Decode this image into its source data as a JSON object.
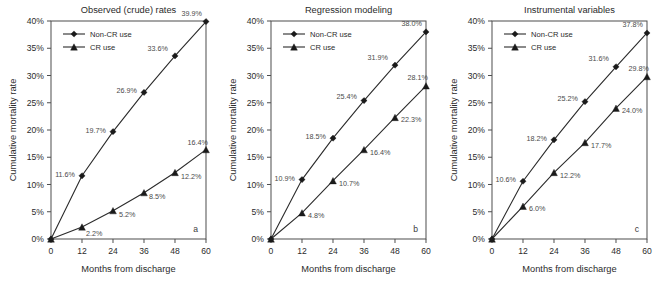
{
  "figure": {
    "panel_letters": [
      "a",
      "b",
      "c"
    ],
    "shared_xlabel": "Months from discharge",
    "shared_ylabel": "Cumulative mortality rate",
    "legend_entries": [
      {
        "label": "Non-CR use",
        "marker": "diamond-marker-icon"
      },
      {
        "label": "CR use",
        "marker": "triangle-marker-icon"
      }
    ]
  },
  "chart_data": [
    {
      "type": "line",
      "title": "Observed (crude) rates",
      "panel": "a",
      "xlabel": "Months from discharge",
      "ylabel": "Cumulative mortality rate",
      "x": [
        0,
        12,
        24,
        36,
        48,
        60
      ],
      "xlim": [
        0,
        60
      ],
      "ylim": [
        0,
        40
      ],
      "xticks": [
        "0",
        "12",
        "24",
        "36",
        "48",
        "60"
      ],
      "yticks": [
        "0%",
        "5%",
        "10%",
        "15%",
        "20%",
        "25%",
        "30%",
        "35%",
        "40%"
      ],
      "grid": false,
      "legend_position": "upper-left-inside",
      "series": [
        {
          "name": "Non-CR use",
          "marker": "diamond",
          "values": [
            0,
            11.6,
            19.7,
            26.9,
            33.6,
            39.9
          ],
          "labels": [
            "",
            "11.6%",
            "19.7%",
            "26.9%",
            "33.6%",
            "39.9%"
          ]
        },
        {
          "name": "CR use",
          "marker": "triangle",
          "values": [
            0,
            2.2,
            5.2,
            8.5,
            12.2,
            16.4
          ],
          "labels": [
            "",
            "2.2%",
            "5.2%",
            "8.5%",
            "12.2%",
            "16.4%"
          ]
        }
      ]
    },
    {
      "type": "line",
      "title": "Regression modeling",
      "panel": "b",
      "xlabel": "Months from discharge",
      "ylabel": "Cumulative mortality rate",
      "x": [
        0,
        12,
        24,
        36,
        48,
        60
      ],
      "xlim": [
        0,
        60
      ],
      "ylim": [
        0,
        40
      ],
      "xticks": [
        "0",
        "12",
        "24",
        "36",
        "48",
        "60"
      ],
      "yticks": [
        "0%",
        "5%",
        "10%",
        "15%",
        "20%",
        "25%",
        "30%",
        "35%",
        "40%"
      ],
      "grid": false,
      "legend_position": "upper-left-inside",
      "series": [
        {
          "name": "Non-CR use",
          "marker": "diamond",
          "values": [
            0,
            10.9,
            18.5,
            25.4,
            31.9,
            38.0
          ],
          "labels": [
            "",
            "10.9%",
            "18.5%",
            "25.4%",
            "31.9%",
            "38.0%"
          ]
        },
        {
          "name": "CR use",
          "marker": "triangle",
          "values": [
            0,
            4.8,
            10.7,
            16.4,
            22.3,
            28.1
          ],
          "labels": [
            "",
            "4.8%",
            "10.7%",
            "16.4%",
            "22.3%",
            "28.1%"
          ]
        }
      ]
    },
    {
      "type": "line",
      "title": "Instrumental variables",
      "panel": "c",
      "xlabel": "Months from discharge",
      "ylabel": "Cumulative mortality rate",
      "x": [
        0,
        12,
        24,
        36,
        48,
        60
      ],
      "xlim": [
        0,
        60
      ],
      "ylim": [
        0,
        40
      ],
      "xticks": [
        "0",
        "12",
        "24",
        "36",
        "48",
        "60"
      ],
      "yticks": [
        "0%",
        "5%",
        "10%",
        "15%",
        "20%",
        "25%",
        "30%",
        "35%",
        "40%"
      ],
      "grid": false,
      "legend_position": "upper-left-inside",
      "series": [
        {
          "name": "Non-CR use",
          "marker": "diamond",
          "values": [
            0,
            10.6,
            18.2,
            25.2,
            31.6,
            37.8
          ],
          "labels": [
            "",
            "10.6%",
            "18.2%",
            "25.2%",
            "31.6%",
            "37.8%"
          ]
        },
        {
          "name": "CR use",
          "marker": "triangle",
          "values": [
            0,
            6.0,
            12.2,
            17.7,
            24.0,
            29.8
          ],
          "labels": [
            "",
            "6.0%",
            "12.2%",
            "17.7%",
            "24.0%",
            "29.8%"
          ]
        }
      ]
    }
  ]
}
